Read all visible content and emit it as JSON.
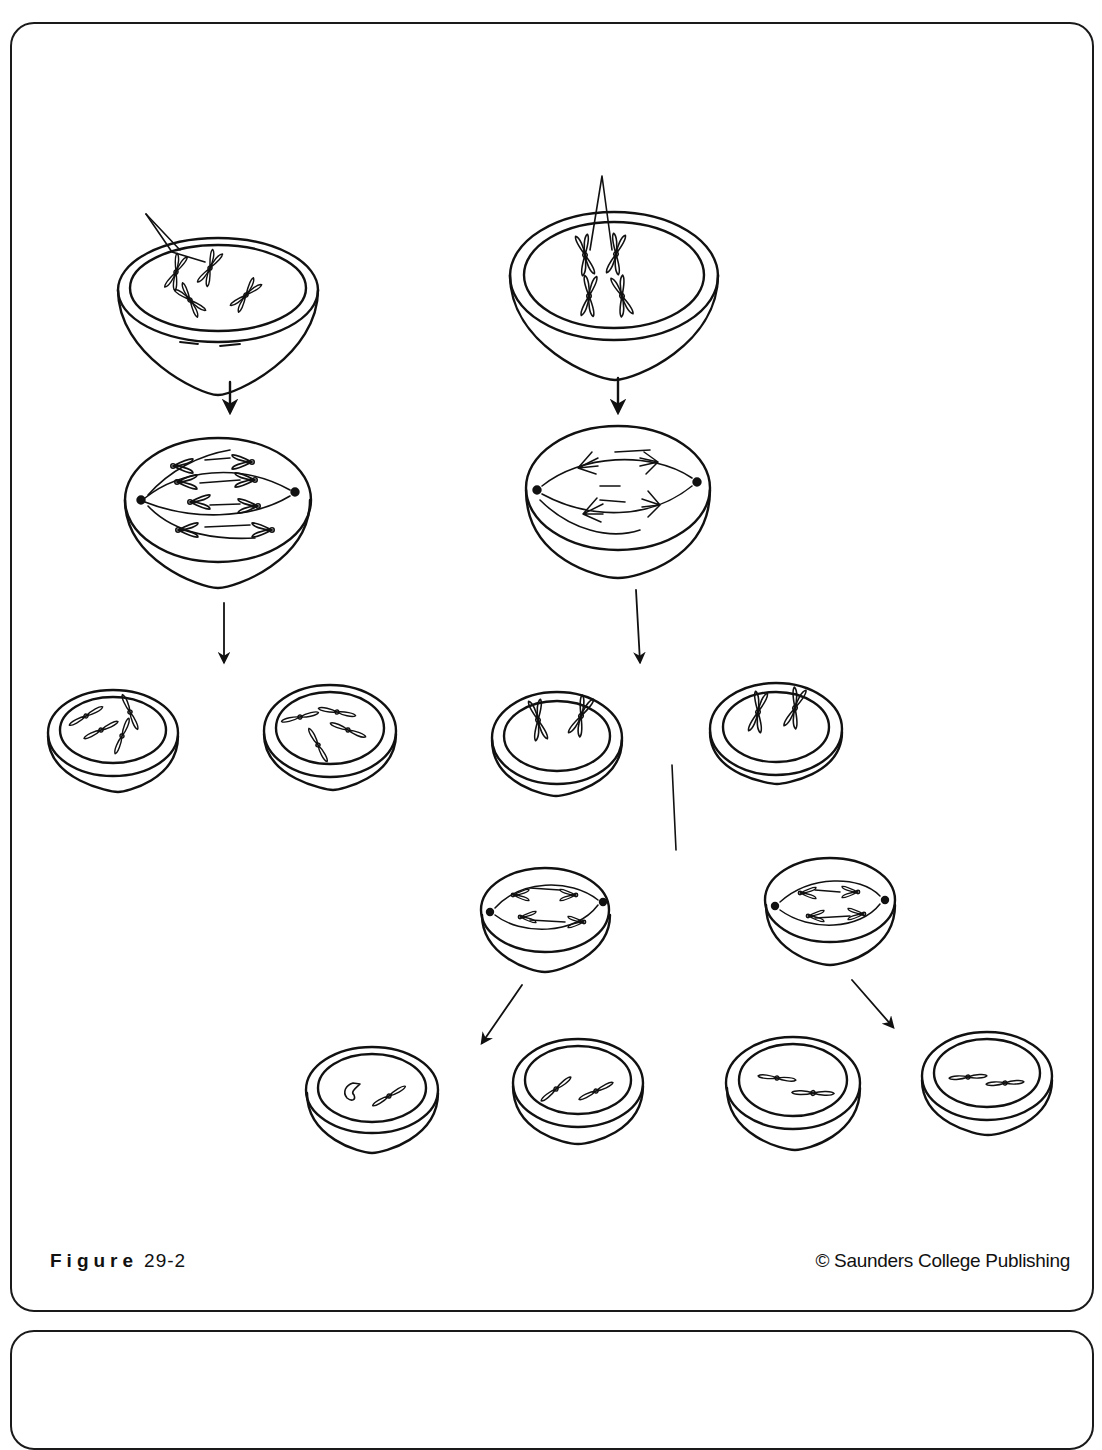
{
  "figure": {
    "label_word": "Figure",
    "label_number": "29-2",
    "copyright": "© Saunders College Publishing"
  },
  "diagram": {
    "stroke_color": "#111111",
    "background_color": "#ffffff",
    "left_pathway": {
      "stages": [
        "parent-cell-with-4-chromosomes",
        "metaphase-spindle",
        "two-daughter-cells"
      ],
      "daughter_cell_count": 2,
      "chromosomes_per_daughter": 4
    },
    "right_pathway": {
      "stages": [
        "parent-cell-with-4-chromosomes",
        "metaphase-I-spindle",
        "two-cells-after-division-I",
        "metaphase-II-spindles",
        "four-cells-after-division-II"
      ],
      "cells_after_division_I": 2,
      "cells_after_division_II": 4,
      "chromosomes_per_final_cell": 2
    }
  }
}
